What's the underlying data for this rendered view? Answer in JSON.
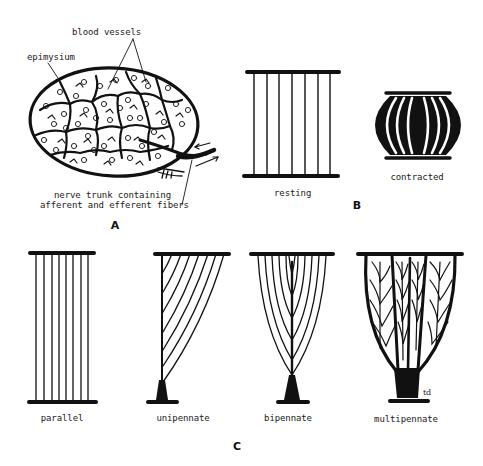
{
  "figure": {
    "panels": {
      "A": {
        "letter": "A",
        "labels": {
          "blood_vessels": "blood vessels",
          "epimysium": "epimysium",
          "nerve_line1": "nerve trunk containing",
          "nerve_line2": "afferent and efferent fibers"
        }
      },
      "B": {
        "letter": "B",
        "labels": {
          "resting": "resting",
          "contracted": "contracted"
        }
      },
      "C": {
        "letter": "C",
        "labels": {
          "parallel": "parallel",
          "unipennate": "unipennate",
          "bipennate": "bipennate",
          "multipennate": "multipennate",
          "td": "td"
        }
      }
    },
    "colors": {
      "ink": "#111111",
      "background": "#ffffff"
    }
  }
}
